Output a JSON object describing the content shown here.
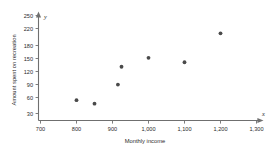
{
  "chart_data": {
    "type": "scatter",
    "title": "",
    "xlabel": "Monthly income",
    "ylabel": "Amount spent on recreation",
    "x_axis_variable": "x",
    "y_axis_variable": "y",
    "xlim": [
      700,
      1300
    ],
    "ylim": [
      30,
      250
    ],
    "grid": false,
    "legend": "none",
    "x_tick_labels": [
      "700",
      "800",
      "900",
      "1,000",
      "1,100",
      "1,200",
      "1,300"
    ],
    "x_tick_values": [
      700,
      800,
      900,
      1000,
      1100,
      1200,
      1300
    ],
    "y_tick_labels": [
      "30",
      "60",
      "90",
      "120",
      "150",
      "180",
      "220",
      "250"
    ],
    "y_tick_values": [
      30,
      60,
      90,
      120,
      150,
      180,
      220,
      250
    ],
    "points": [
      {
        "x": 800,
        "y": 60
      },
      {
        "x": 850,
        "y": 52
      },
      {
        "x": 915,
        "y": 95
      },
      {
        "x": 925,
        "y": 135
      },
      {
        "x": 1000,
        "y": 155
      },
      {
        "x": 1100,
        "y": 145
      },
      {
        "x": 1200,
        "y": 210
      }
    ]
  },
  "axes": {
    "x_title": "Monthly income",
    "y_title": "Amount spent on recreation",
    "x_var": "x",
    "y_var": "y"
  },
  "ticks": {
    "x": [
      "700",
      "800",
      "900",
      "1,000",
      "1,100",
      "1,200",
      "1,300"
    ],
    "y": [
      "250",
      "220",
      "180",
      "150",
      "120",
      "90",
      "60",
      "30"
    ]
  },
  "colors": {
    "axis": "#6f6f6f",
    "marker": "#4a4a4a",
    "text": "#2b2b2b",
    "background": "#ffffff"
  }
}
